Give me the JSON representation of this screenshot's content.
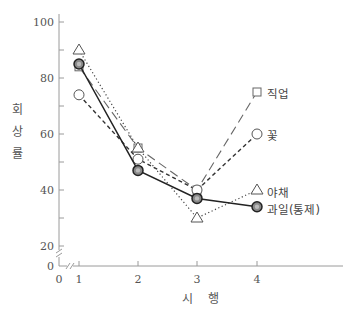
{
  "chart_data": {
    "type": "line",
    "title": "",
    "xlabel": "시 행",
    "ylabel": "회상률",
    "x": [
      1,
      2,
      3,
      4
    ],
    "x_ticks": [
      "0",
      "1",
      "2",
      "3",
      "4"
    ],
    "y_ticks": [
      "0",
      "20",
      "40",
      "60",
      "80",
      "100"
    ],
    "y_minor_ticks": [
      30,
      50,
      70,
      90
    ],
    "ylim": [
      0,
      100
    ],
    "axis_break": true,
    "grid": false,
    "legend_position": "inline-right",
    "series": [
      {
        "name": "직업",
        "marker": "square",
        "line": "long-dash",
        "values": [
          84,
          55,
          40,
          75
        ]
      },
      {
        "name": "꽃",
        "marker": "circle",
        "line": "short-dash",
        "values": [
          74,
          51,
          40,
          60
        ]
      },
      {
        "name": "야채",
        "marker": "triangle",
        "line": "dotted",
        "values": [
          90,
          55,
          30,
          40
        ]
      },
      {
        "name": "과일(통제)",
        "marker": "filled-circle",
        "line": "solid",
        "values": [
          85,
          47,
          37,
          34
        ]
      }
    ]
  },
  "axis": {
    "ylabel_chars": [
      "회",
      "상",
      "률"
    ],
    "xlabel_chars": [
      "시",
      "행"
    ]
  },
  "colors": {
    "axis": "#9a9a9a",
    "series_line": "#333333",
    "marker_fill": "#888888"
  }
}
